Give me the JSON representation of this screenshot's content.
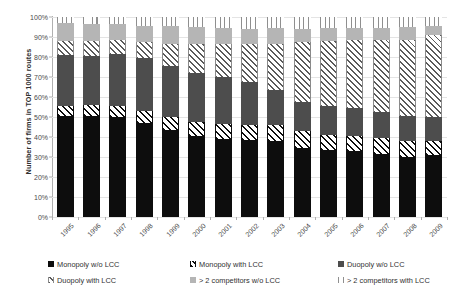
{
  "chart_data": {
    "type": "bar",
    "stacked": true,
    "title": "",
    "xlabel": "",
    "ylabel": "Number of firms in TOP 1000 routes",
    "ylim": [
      0,
      100
    ],
    "ytick_labels": [
      "0%",
      "10%",
      "20%",
      "30%",
      "40%",
      "50%",
      "60%",
      "70%",
      "80%",
      "90%",
      "100%"
    ],
    "ytick_values": [
      0,
      10,
      20,
      30,
      40,
      50,
      60,
      70,
      80,
      90,
      100
    ],
    "grid": true,
    "legend_position": "bottom",
    "categories": [
      "1995",
      "1996",
      "1997",
      "1998",
      "1999",
      "2000",
      "2001",
      "2002",
      "2003",
      "2004",
      "2005",
      "2006",
      "2007",
      "2008",
      "2009"
    ],
    "series": [
      {
        "name": "Monopoly w/o LCC",
        "pattern": "solid-black",
        "color": "#0d0d0d",
        "values": [
          50.5,
          50.5,
          50.0,
          47.0,
          43.5,
          40.5,
          39.0,
          38.5,
          38.0,
          34.5,
          33.5,
          33.0,
          31.5,
          30.0,
          31.0
        ]
      },
      {
        "name": "Monopoly with LCC",
        "pattern": "diagonal-black",
        "color": "#0d0d0d",
        "values": [
          5.0,
          5.5,
          5.5,
          6.0,
          6.5,
          7.0,
          7.5,
          7.5,
          8.0,
          8.5,
          7.5,
          7.5,
          8.0,
          8.0,
          7.0
        ]
      },
      {
        "name": "Duopoly w/o LCC",
        "pattern": "solid-darkgray",
        "color": "#4d4d4d",
        "values": [
          25.5,
          24.5,
          26.0,
          26.5,
          25.5,
          24.5,
          23.5,
          21.5,
          17.5,
          14.5,
          14.5,
          14.0,
          13.0,
          12.5,
          12.0
        ]
      },
      {
        "name": "Duopoly with LCC",
        "pattern": "diagonal-gray",
        "color": "#8a8a8a",
        "values": [
          7.0,
          7.5,
          7.0,
          8.0,
          11.0,
          14.5,
          16.5,
          19.0,
          23.0,
          30.0,
          32.5,
          34.0,
          36.0,
          38.0,
          41.0
        ]
      },
      {
        "name": "> 2 competitors w/o LCC",
        "pattern": "solid-lightgray",
        "color": "#b5b5b5",
        "values": [
          9.0,
          8.5,
          8.0,
          8.0,
          9.0,
          8.5,
          8.0,
          7.5,
          8.0,
          6.5,
          6.5,
          6.0,
          6.0,
          6.5,
          4.5
        ]
      },
      {
        "name": "> 2 competitors with LCC",
        "pattern": "vertical-lines",
        "color": "#8f8f8f",
        "values": [
          3.0,
          3.5,
          3.5,
          4.5,
          4.5,
          5.0,
          5.5,
          6.0,
          5.5,
          6.0,
          5.5,
          5.5,
          5.5,
          5.0,
          4.5
        ]
      }
    ]
  },
  "legend": {
    "rows": [
      [
        {
          "label": "Monopoly w/o LCC",
          "swatch": "solid-black"
        },
        {
          "label": "Monopoly with LCC",
          "swatch": "diagonal-black"
        },
        {
          "label": "Duopoly w/o LCC",
          "swatch": "solid-darkgray"
        }
      ],
      [
        {
          "label": "Duopoly with LCC",
          "swatch": "diagonal-gray"
        },
        {
          "label": "> 2 competitors w/o LCC",
          "swatch": "solid-lightgray"
        },
        {
          "label": "> 2 competitors with LCC",
          "swatch": "vertical-lines"
        }
      ]
    ]
  }
}
